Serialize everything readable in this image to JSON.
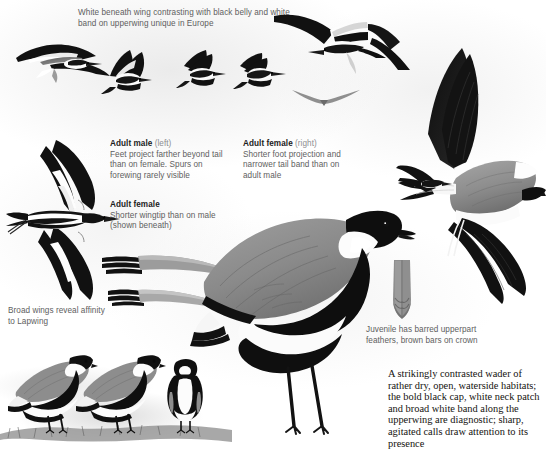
{
  "plate": {
    "subject": "Spur-winged Lapwing",
    "background_color": "#ffffff",
    "ink_color": "#15130f",
    "caption_color": "#5e5e60",
    "heading_color": "#1b1b1b",
    "qualifier_color": "#8e8e90"
  },
  "captions": {
    "top_flight": "White beneath wing contrasting with black belly and white band on upperwing unique in Europe",
    "adult_male": {
      "heading": "Adult male",
      "qualifier": "(left)",
      "body": "Feet project farther beyond tail than on female. Spurs on forewing rarely visible"
    },
    "adult_female_right": {
      "heading": "Adult female",
      "qualifier": "(right)",
      "body": "Shorter foot projection and narrower tail band than on adult male"
    },
    "adult_female_wingtip": {
      "heading": "Adult female",
      "qualifier": "",
      "body": "Shorter wingtip than on male (shown beneath)"
    },
    "broad_wings": "Broad wings reveal affinity to Lapwing",
    "juvenile": "Juvenile has barred upperpart feathers, brown bars on crown"
  },
  "description": {
    "text": "A strikingly contrasted wader of rather dry, open, waterside habitats; the bold black cap, white neck patch and broad white band along the upperwing are diagnostic; sharp, agitated calls draw attention to its presence"
  },
  "figures": [
    {
      "name": "flying-bird-upperwing-far-left",
      "pose": "gliding, upperwing shown"
    },
    {
      "name": "flying-bird-upperwing-mid-left",
      "pose": "wings raised"
    },
    {
      "name": "flying-bird-upperwing-mid",
      "pose": "wings down"
    },
    {
      "name": "flying-bird-upperwing-mid-right",
      "pose": "wings down, head right"
    },
    {
      "name": "flying-bird-underwing-top-right",
      "pose": "underwing, head-on"
    },
    {
      "name": "flying-bird-distant-silhouette",
      "pose": "distant silhouette"
    },
    {
      "name": "flying-bird-underwing-large-left",
      "pose": "large underwing, adult male"
    },
    {
      "name": "flying-bird-underwing-large-right",
      "pose": "large underwing, adult female"
    },
    {
      "name": "wingtip-detail-male",
      "pose": "wingtip detail"
    },
    {
      "name": "wingtip-detail-female",
      "pose": "wingtip detail, shorter"
    },
    {
      "name": "standing-adult-left",
      "pose": "standing, side view"
    },
    {
      "name": "standing-adult-right",
      "pose": "standing, side view"
    },
    {
      "name": "standing-adult-front",
      "pose": "standing, front view"
    },
    {
      "name": "standing-adult-large",
      "pose": "large standing adult, side view"
    },
    {
      "name": "juvenile-feather-detail",
      "pose": "single barred feather"
    }
  ]
}
